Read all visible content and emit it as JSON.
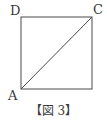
{
  "figure": {
    "caption": "【図 3】",
    "shape": "square",
    "vertices": {
      "A": {
        "label": "A",
        "position": "bottom-left"
      },
      "C": {
        "label": "C",
        "position": "top-right"
      },
      "D": {
        "label": "D",
        "position": "top-left"
      }
    },
    "segments": [
      {
        "from": "A",
        "to": "C",
        "type": "diagonal"
      }
    ],
    "colors": {
      "stroke": "#4a4a4a",
      "text": "#3a3a3a",
      "background": "#ffffff"
    }
  }
}
